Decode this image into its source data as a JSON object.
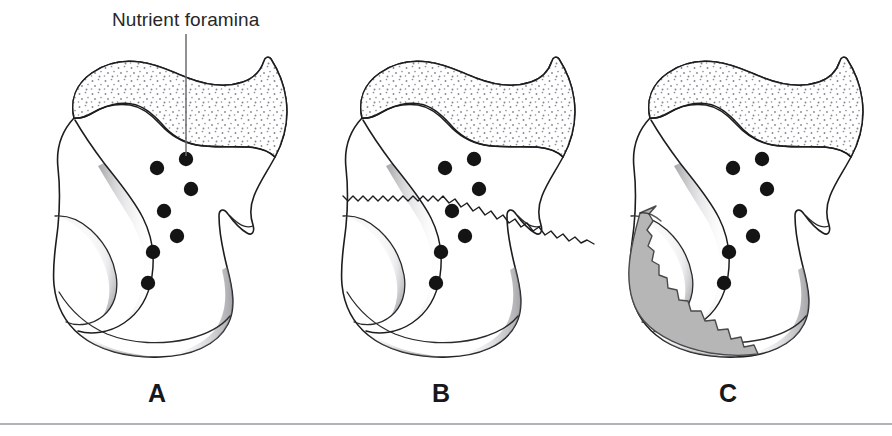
{
  "figure": {
    "title_label": "Nutrient foramina",
    "background_color": "#ffffff",
    "ink_color": "#1d1d1f",
    "foramen_color": "#141414",
    "fragment_color": "#b6b6b6",
    "cartilage_stipple_color": "#8a8a90",
    "leader_color": "#6b6b70",
    "rule_color": "#9a9a9f",
    "width": 892,
    "height": 436
  },
  "callout": {
    "label": "Nutrient foramina",
    "text_x": 112,
    "text_y": 26,
    "leader_x": 186,
    "leader_y_top": 34,
    "leader_y_bottom": 156
  },
  "panels": [
    {
      "id": "panel-a",
      "letter": "A",
      "letter_x": 157,
      "letter_y": 402,
      "description": "Intact calcaneus with nutrient foramina",
      "has_fracture_line": false,
      "has_displaced_fragment": false,
      "foramina_count": 7,
      "foramina": [
        {
          "cx": 186,
          "cy": 159,
          "r": 7.2
        },
        {
          "cx": 157,
          "cy": 168,
          "r": 7.2
        },
        {
          "cx": 191,
          "cy": 189,
          "r": 7.2
        },
        {
          "cx": 164,
          "cy": 211,
          "r": 7.2
        },
        {
          "cx": 177,
          "cy": 236,
          "r": 7.2
        },
        {
          "cx": 153,
          "cy": 252,
          "r": 7.2
        },
        {
          "cx": 148,
          "cy": 283,
          "r": 7.2
        }
      ]
    },
    {
      "id": "panel-b",
      "letter": "B",
      "letter_x": 441,
      "letter_y": 402,
      "description": "Calcaneus with nondisplaced fracture line",
      "has_fracture_line": true,
      "has_displaced_fragment": false,
      "foramina_count": 7,
      "foramina": [
        {
          "cx": 474,
          "cy": 159,
          "r": 7.2
        },
        {
          "cx": 445,
          "cy": 168,
          "r": 7.2
        },
        {
          "cx": 479,
          "cy": 189,
          "r": 7.2
        },
        {
          "cx": 452,
          "cy": 211,
          "r": 7.2
        },
        {
          "cx": 465,
          "cy": 236,
          "r": 7.2
        },
        {
          "cx": 441,
          "cy": 252,
          "r": 7.2
        },
        {
          "cx": 436,
          "cy": 283,
          "r": 7.2
        }
      ]
    },
    {
      "id": "panel-c",
      "letter": "C",
      "letter_x": 728,
      "letter_y": 402,
      "description": "Calcaneus with displaced bone fragment",
      "has_fracture_line": false,
      "has_displaced_fragment": true,
      "foramina_count": 7,
      "foramina": [
        {
          "cx": 762,
          "cy": 159,
          "r": 7.2
        },
        {
          "cx": 733,
          "cy": 168,
          "r": 7.2
        },
        {
          "cx": 767,
          "cy": 189,
          "r": 7.2
        },
        {
          "cx": 740,
          "cy": 211,
          "r": 7.2
        },
        {
          "cx": 753,
          "cy": 236,
          "r": 7.2
        },
        {
          "cx": 729,
          "cy": 252,
          "r": 7.2
        },
        {
          "cx": 724,
          "cy": 283,
          "r": 7.2
        }
      ]
    }
  ],
  "baseline": {
    "x1": 0,
    "x2": 892,
    "y": 424
  }
}
